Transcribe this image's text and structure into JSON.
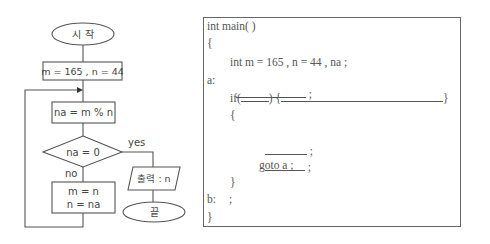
{
  "flowchart": {
    "start": "시 작",
    "init": "m = 165 , n = 44",
    "compute": "na = m % n",
    "condition": "na = 0",
    "yes_label": "yes",
    "no_label": "no",
    "update_line1": "m = n",
    "update_line2": "n = na",
    "output": "출력 : n",
    "end": "끝"
  },
  "code": {
    "line1": "int main( )",
    "line2": "{",
    "line3": "int m = 165 , n = 44 , na ;",
    "label_a": "a:",
    "semicolon": ";",
    "if_kw": "if(",
    "if_close": ") {",
    "if_brace_close": "}",
    "open_brace": "{",
    "goto": "goto a ;",
    "close_brace": "}",
    "label_b": "b:",
    "end_brace": "}"
  }
}
